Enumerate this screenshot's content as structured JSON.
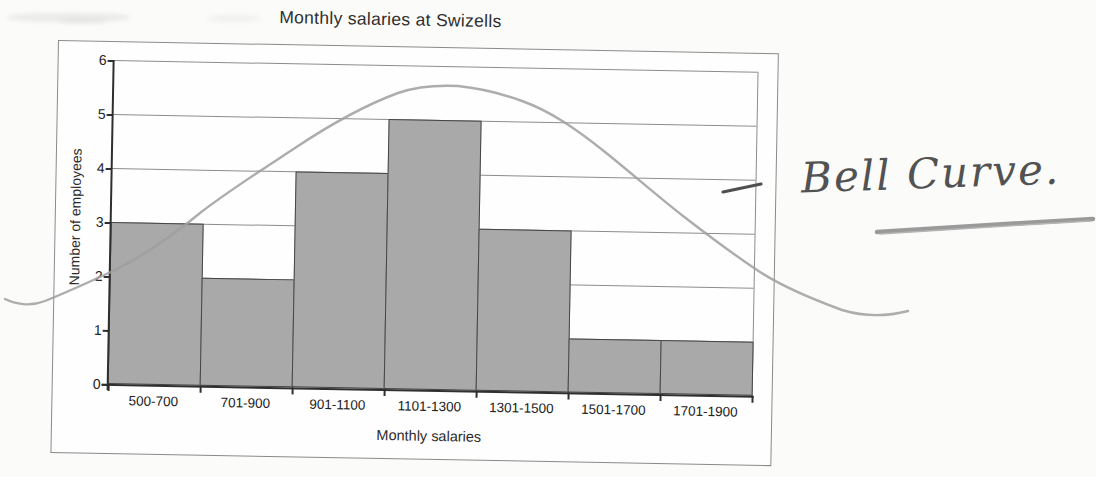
{
  "chart_data": {
    "type": "bar",
    "title": "Monthly salaries at Swizells",
    "xlabel": "Monthly salaries",
    "ylabel": "Number of employees",
    "categories": [
      "500-700",
      "701-900",
      "901-1100",
      "1101-1300",
      "1301-1500",
      "1501-1700",
      "1701-1900"
    ],
    "values": [
      3,
      2,
      4,
      5,
      3,
      1,
      1
    ],
    "ylim": [
      0,
      6
    ],
    "yticks": [
      0,
      1,
      2,
      3,
      4,
      5,
      6
    ],
    "grid": "horizontal gridlines on",
    "legend": "none",
    "overlay_annotation": "hand-drawn bell curve sketched in pencil over the bars, peaking near 5.5 above the 1101-1300 bar"
  },
  "handwriting": {
    "label": "Bell Curve.",
    "has_underline": true,
    "pointer_dash": "short dash pointing at the curve near the chart's right edge"
  },
  "colors": {
    "bar_fill": "#a9a9a9",
    "bar_border": "#454545",
    "gridline": "#8c8c8c",
    "axis": "#2f2f2f",
    "pencil_curve": "#9f9f9f",
    "handwriting_ink": "#525252",
    "paper": "#fbfbf9"
  }
}
